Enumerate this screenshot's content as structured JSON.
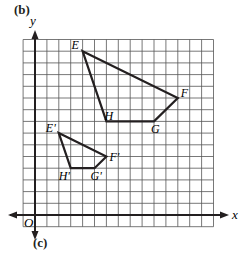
{
  "figure": {
    "top_label": "(b)",
    "bottom_label": "(c)",
    "x_axis_label": "x",
    "y_axis_label": "y",
    "origin_label": "O"
  },
  "grid": {
    "x_min": -1,
    "x_max": 15,
    "y_min": -1,
    "y_max": 15,
    "step": 1,
    "line_color": "#555555",
    "axis_color": "#231f20"
  },
  "polygons": [
    {
      "name": "EFGH",
      "vertices": [
        {
          "label": "E",
          "x": 4,
          "y": 14
        },
        {
          "label": "F",
          "x": 12,
          "y": 10
        },
        {
          "label": "G",
          "x": 10,
          "y": 8
        },
        {
          "label": "H",
          "x": 6,
          "y": 8
        }
      ]
    },
    {
      "name": "E'F'G'H'",
      "vertices": [
        {
          "label": "E'",
          "x": 2,
          "y": 7
        },
        {
          "label": "F'",
          "x": 6,
          "y": 5
        },
        {
          "label": "G'",
          "x": 5,
          "y": 4
        },
        {
          "label": "H'",
          "x": 3,
          "y": 4
        }
      ]
    }
  ]
}
